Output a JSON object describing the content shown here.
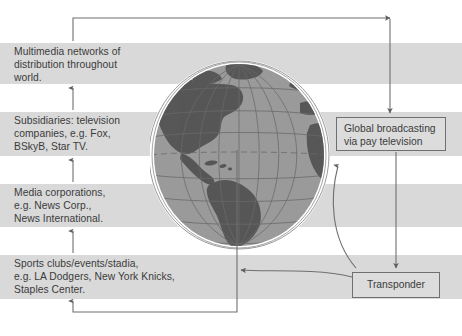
{
  "diagram": {
    "colors": {
      "band": "#d9d9d9",
      "box_fill": "#dcdcdc",
      "box_border": "#6f6f6f",
      "text": "#3b3b3b",
      "ocean": "#9a9a9a",
      "land": "#5c5c5c",
      "graticule": "#6a6a6a",
      "halo": "#ffffff",
      "arrow": "#6f6f6f"
    },
    "stack": [
      {
        "id": "multimedia-networks",
        "text": "Multimedia networks of\ndistribution throughout\nworld."
      },
      {
        "id": "subsidiaries",
        "text": "Subsidiaries: television\ncompanies, e.g. Fox,\nBSkyB, Star TV."
      },
      {
        "id": "media-corporations",
        "text": "Media corporations,\ne.g. News Corp.,\nNews International."
      },
      {
        "id": "sports-clubs",
        "text": "Sports clubs/events/stadia,\ne.g. LA Dodgers, New York Knicks,\nStaples Center."
      }
    ],
    "boxes": [
      {
        "id": "global-broadcasting",
        "text": "Global broadcasting\nvia pay television"
      },
      {
        "id": "transponder",
        "text": "Transponder"
      }
    ],
    "connectors": [
      {
        "id": "sports-to-media",
        "kind": "vertical-up-arrow"
      },
      {
        "id": "media-to-subsidiaries",
        "kind": "vertical-up-arrow"
      },
      {
        "id": "subsidiaries-to-multimedia",
        "kind": "vertical-up-arrow"
      },
      {
        "id": "multimedia-to-global-broadcasting",
        "kind": "elbow-up-right-down-arrow"
      },
      {
        "id": "global-broadcasting-to-transponder",
        "kind": "vertical-down-arrow"
      },
      {
        "id": "transponder-to-globe",
        "kind": "curved-left-arrow"
      },
      {
        "id": "globe-uplink-to-global-broadcasting",
        "kind": "curved-up-arrow"
      },
      {
        "id": "globe-down-to-sports",
        "kind": "elbow-down-left-up-arrow"
      }
    ]
  }
}
